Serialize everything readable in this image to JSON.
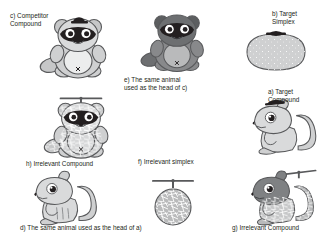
{
  "figure": {
    "background_color": "#ffffff",
    "text_color": "#231f20"
  },
  "palette": {
    "outline": "#58595b",
    "body_light": "#d9dadb",
    "body_mid": "#b9babb",
    "body_dark": "#8a8c8e",
    "belly": "#eceded",
    "mask_dark": "#231f20",
    "eye_white": "#ffffff",
    "mesh_line": "#ffffff"
  },
  "panels": [
    {
      "id": "c",
      "label": "c) Competitor\nCompound",
      "subject": "raccoon-with-small-cap",
      "shade": "light"
    },
    {
      "id": "e",
      "label": "e) The same animal\nused as the head of c)",
      "subject": "raccoon-no-hat",
      "shade": "dark"
    },
    {
      "id": "b",
      "label": "b) Target\nSimplex",
      "subject": "simplex-blob-with-cap",
      "shade": "light"
    },
    {
      "id": "h",
      "label": "h) Irrelevant Compound",
      "subject": "raccoon-with-propeller-mesh",
      "shade": "mesh"
    },
    {
      "id": "a",
      "label": "a) Target\nCompound",
      "subject": "squirrel-with-cap",
      "shade": "light"
    },
    {
      "id": "d",
      "label": "d) The same animal used as the head of a)",
      "subject": "squirrel-plain",
      "shade": "light"
    },
    {
      "id": "f",
      "label": "f) Irrelevant simplex",
      "subject": "mesh-circle-with-propeller",
      "shade": "mesh"
    },
    {
      "id": "g",
      "label": "g) Irrelevant Compound",
      "subject": "squirrel-with-propeller-mesh",
      "shade": "mesh"
    }
  ]
}
